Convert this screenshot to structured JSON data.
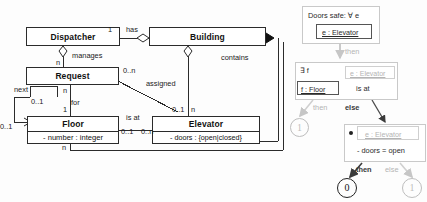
{
  "diagram": {
    "left_panel": {
      "classes": [
        {
          "name": "Dispatcher",
          "attributes": []
        },
        {
          "name": "Building",
          "attributes": []
        },
        {
          "name": "Request",
          "attributes": []
        },
        {
          "name": "Floor",
          "attributes": [
            "- number : integer"
          ]
        },
        {
          "name": "Elevator",
          "attributes": [
            "- doors : {open|closed}"
          ]
        }
      ],
      "associations": [
        {
          "name": "has",
          "source": "Dispatcher",
          "target": "Building",
          "source_mult": "1",
          "target_mult": "",
          "target_end": "aggregation"
        },
        {
          "name": "manages",
          "source": "Dispatcher",
          "target": "Request",
          "source_mult": "",
          "target_mult": "n",
          "source_end": "aggregation"
        },
        {
          "name": "contains",
          "source": "Building",
          "target": "Elevator",
          "source_mult": "",
          "target_mult": "",
          "source_end": "composition"
        },
        {
          "name": "",
          "source": "Building",
          "target": "Floor",
          "source_mult": "",
          "target_mult": "n",
          "source_end": "aggregation"
        },
        {
          "name": "assigned",
          "source": "Request",
          "target": "Elevator",
          "source_mult": "0..n",
          "target_mult": "0..1"
        },
        {
          "name": "for",
          "source": "Request",
          "target": "Floor",
          "source_mult": "n",
          "target_mult": "1"
        },
        {
          "name": "is at",
          "source": "Floor",
          "target": "Elevator",
          "source_mult": "0..1",
          "target_mult": "0..n"
        },
        {
          "name": "next",
          "source": "Floor",
          "target": "Floor",
          "source_mult": "0..1",
          "target_mult": "0..1"
        }
      ],
      "labels": {
        "has": "has",
        "manages": "manages",
        "contains": "contains",
        "assigned": "assigned",
        "for": "for",
        "is_at": "is at",
        "next": "next",
        "m_1": "1",
        "m_n_manages": "n",
        "m_0n_assigned": "0..n",
        "m_01_assigned": "0..1",
        "m_n_for": "n",
        "m_1_for": "1",
        "m_01_isat": "0..1",
        "m_0n_isat": "0..n",
        "m_n_building_floor": "n",
        "m_n_bottom": "n",
        "m_01_next_a": "0..1",
        "m_01_next_b": "0..1"
      }
    },
    "right_panel": {
      "root": {
        "label": "Doors safe: ∀ e",
        "binding": "e : Elevator"
      },
      "edge_then_1": "then",
      "level2": {
        "quantifier": "∃ f",
        "binding_dim": "e : Elevator",
        "binding_active": "f : Floor",
        "relation": "is at"
      },
      "edge_then_2": "then",
      "edge_else_2": "else",
      "result_left": "1",
      "level3": {
        "binding_dim": "e : Elevator",
        "condition": "- doors = open"
      },
      "edge_then_3": "then",
      "edge_else_3": "else",
      "result_then": "0",
      "result_else": "1"
    }
  },
  "colors": {
    "ink": "#2b2b2b",
    "dim": "#b4b4b4",
    "panel_border": "#c9c9c9",
    "paper": "#ffffff"
  }
}
